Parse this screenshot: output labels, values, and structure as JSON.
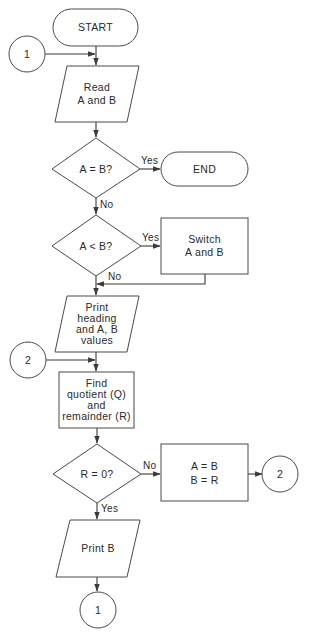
{
  "diagram": {
    "type": "flowchart",
    "colors": {
      "stroke": "#4a4a4a",
      "text": "#2a2a2a",
      "background": "#ffffff"
    },
    "nodes": {
      "start": {
        "shape": "terminal",
        "text": "START"
      },
      "connector_1_in": {
        "shape": "connector",
        "text": "1"
      },
      "read": {
        "shape": "input-output",
        "lines": [
          "Read",
          "A and B"
        ]
      },
      "decision_equal": {
        "shape": "decision",
        "text": "A = B?"
      },
      "end": {
        "shape": "terminal",
        "text": "END"
      },
      "decision_less": {
        "shape": "decision",
        "text": "A < B?"
      },
      "switch": {
        "shape": "process",
        "lines": [
          "Switch",
          "A and B"
        ]
      },
      "print_heading": {
        "shape": "input-output",
        "lines": [
          "Print",
          "heading",
          "and A, B",
          "values"
        ]
      },
      "connector_2_in": {
        "shape": "connector",
        "text": "2"
      },
      "find": {
        "shape": "process",
        "lines": [
          "Find",
          "quotient (Q)",
          "and",
          "remainder (R)"
        ]
      },
      "decision_remainder": {
        "shape": "decision",
        "text": "R = 0?"
      },
      "assign": {
        "shape": "process",
        "lines": [
          "A = B",
          "B = R"
        ]
      },
      "connector_2_out": {
        "shape": "connector",
        "text": "2"
      },
      "print_b": {
        "shape": "input-output",
        "text": "Print B"
      },
      "connector_1_out": {
        "shape": "connector",
        "text": "1"
      }
    },
    "edges": {
      "equal_yes": "Yes",
      "equal_no": "No",
      "less_yes": "Yes",
      "less_no": "No",
      "remainder_no": "No",
      "remainder_yes": "Yes"
    }
  }
}
